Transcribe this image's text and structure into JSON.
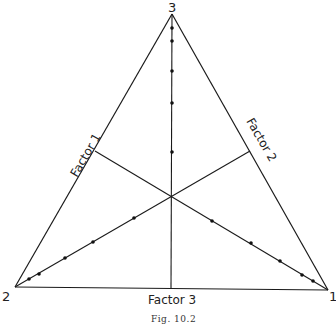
{
  "figure": {
    "caption": "Fig. 10.2",
    "vertices": [
      {
        "label": "3",
        "x": 172,
        "y": 14
      },
      {
        "label": "2",
        "x": 15,
        "y": 287
      },
      {
        "label": "1",
        "x": 328,
        "y": 290
      }
    ],
    "center": {
      "x": 172,
      "y": 196
    },
    "factor_axes": [
      {
        "label": "Factor 1",
        "from_vertex": "1",
        "end": {
          "x": 95,
          "y": 151
        }
      },
      {
        "label": "Factor 2",
        "from_vertex": "2",
        "end": {
          "x": 250,
          "y": 151
        }
      },
      {
        "label": "Factor 3",
        "from_vertex": "3",
        "end": {
          "x": 171,
          "y": 288
        }
      }
    ],
    "points": {
      "vertical_axis": [
        [
          172,
          28
        ],
        [
          172,
          41
        ],
        [
          172,
          71
        ],
        [
          172,
          103
        ],
        [
          172,
          152
        ]
      ],
      "axis_to_vertex_2": [
        [
          134,
          218
        ],
        [
          93,
          242
        ],
        [
          65,
          258
        ],
        [
          39,
          274
        ],
        [
          29,
          279
        ]
      ],
      "axis_to_vertex_1": [
        [
          212,
          221
        ],
        [
          251,
          243
        ],
        [
          280,
          261
        ],
        [
          302,
          275
        ],
        [
          313,
          281
        ]
      ]
    }
  }
}
